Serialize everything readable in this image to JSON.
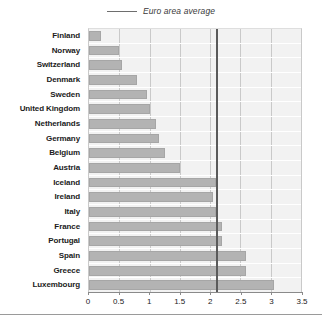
{
  "legend": {
    "label": "Euro area average",
    "marker": "legend-line-icon"
  },
  "axis": {
    "xticks": [
      "0",
      "0.5",
      "1",
      "1.5",
      "2",
      "2.5",
      "3",
      "3.5"
    ],
    "xmin": 0,
    "xmax": 3.5,
    "xstep": 0.5
  },
  "colors": {
    "bar": "#b3b3b3",
    "bar_border": "#a6a6a6",
    "plot_background": "#f2f2f2",
    "gridline": "#c9c9c9",
    "average_line": "#5a5a5a",
    "text": "#1b1b1b"
  },
  "chart_data": {
    "type": "bar",
    "orientation": "horizontal",
    "title": "",
    "subtitle": "",
    "xlabel": "",
    "ylabel": "",
    "xlim": [
      0,
      3.5
    ],
    "grid": true,
    "legend_position": "top-center",
    "categories": [
      "Finland",
      "Norway",
      "Switzerland",
      "Denmark",
      "Sweden",
      "United Kingdom",
      "Netherlands",
      "Germany",
      "Belgium",
      "Austria",
      "Iceland",
      "Ireland",
      "Italy",
      "France",
      "Portugal",
      "Spain",
      "Greece",
      "Luxembourg"
    ],
    "values": [
      0.2,
      0.5,
      0.55,
      0.8,
      0.95,
      1.0,
      1.1,
      1.15,
      1.25,
      1.5,
      2.1,
      2.05,
      2.1,
      2.2,
      2.2,
      2.6,
      2.6,
      3.05
    ],
    "annotations": [
      {
        "name": "euro-area-average",
        "label": "Euro area average",
        "value": 2.1,
        "type": "vertical-line"
      }
    ]
  }
}
